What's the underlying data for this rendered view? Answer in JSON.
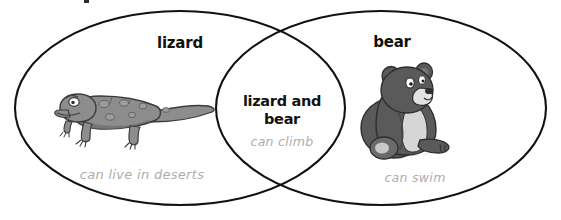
{
  "diagram": {
    "type": "venn",
    "kind": "two-set-venn-diagram",
    "background_color": "#ffffff",
    "outline_color": "#111111",
    "title_color": "#121212",
    "caption_color": "#adadad"
  },
  "left_set": {
    "title": "lizard",
    "caption": "can live in deserts",
    "illustration_name": "lizard-illustration",
    "illustration_colors": {
      "body": "#8d8d8d",
      "body_dark": "#6f6f6f",
      "outline": "#3c3c3c",
      "eye": "#ffffff"
    }
  },
  "right_set": {
    "title": "bear",
    "caption": "can swim",
    "illustration_name": "bear-illustration",
    "illustration_colors": {
      "body": "#5a5a5a",
      "body_dark": "#474747",
      "chest": "#d6d6d6",
      "muzzle": "#e2e2e2",
      "outline": "#2e2e2e",
      "eye": "#ffffff"
    }
  },
  "intersection": {
    "title_line_1": "lizard and",
    "title_line_2": "bear",
    "caption": "can climb"
  }
}
